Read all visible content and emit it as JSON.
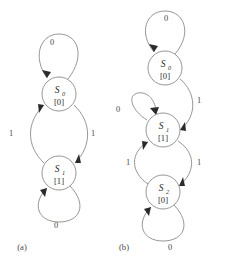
{
  "figure": {
    "background": "#ffffff",
    "stroke_color": "#8a8a8a",
    "text_color": "#2b2b2b",
    "panels": [
      {
        "id": "panel-a",
        "caption": "(a)",
        "caption_pos": {
          "x": 22,
          "y": 250
        },
        "states": [
          {
            "id": "s0",
            "name": "S",
            "subscript": "0",
            "output": "[0]",
            "cx": 59,
            "cy": 94,
            "r": 17
          },
          {
            "id": "s1",
            "name": "S",
            "subscript": "1",
            "output": "[1]",
            "cx": 59,
            "cy": 173,
            "r": 17
          }
        ],
        "transitions": [
          {
            "id": "a-s0-self",
            "from": "s0",
            "to": "s0",
            "label": "0",
            "label_pos": {
              "x": 52,
              "y": 45
            },
            "kind": "self-loop-top"
          },
          {
            "id": "a-s0-to-s1",
            "from": "s0",
            "to": "s1",
            "label": "1",
            "label_pos": {
              "x": 93,
              "y": 136
            },
            "kind": "arc-right-down"
          },
          {
            "id": "a-s1-to-s0",
            "from": "s1",
            "to": "s0",
            "label": "1",
            "label_pos": {
              "x": 11,
              "y": 136
            },
            "kind": "arc-left-up"
          },
          {
            "id": "a-s1-self",
            "from": "s1",
            "to": "s1",
            "label": "0",
            "label_pos": {
              "x": 56,
              "y": 228
            },
            "kind": "self-loop-bottom"
          }
        ]
      },
      {
        "id": "panel-b",
        "caption": "(b)",
        "caption_pos": {
          "x": 124,
          "y": 250
        },
        "states": [
          {
            "id": "s0",
            "name": "S",
            "subscript": "0",
            "output": "[0]",
            "cx": 165,
            "cy": 68,
            "r": 17
          },
          {
            "id": "s1",
            "name": "S",
            "subscript": "1",
            "output": "[1]",
            "cx": 163,
            "cy": 130,
            "r": 17
          },
          {
            "id": "s2",
            "name": "S",
            "subscript": "2",
            "output": "[0]",
            "cx": 163,
            "cy": 192,
            "r": 17
          }
        ],
        "transitions": [
          {
            "id": "b-s0-self",
            "from": "s0",
            "to": "s0",
            "label": "0",
            "label_pos": {
              "x": 166,
              "y": 21
            },
            "kind": "self-loop-top"
          },
          {
            "id": "b-s0-to-s1",
            "from": "s0",
            "to": "s1",
            "label": "1",
            "label_pos": {
              "x": 199,
              "y": 103
            },
            "kind": "arc-right-down"
          },
          {
            "id": "b-s1-self",
            "from": "s1",
            "to": "s1",
            "label": "0",
            "label_pos": {
              "x": 118,
              "y": 112
            },
            "kind": "self-loop-upper-left"
          },
          {
            "id": "b-s1-to-s2",
            "from": "s1",
            "to": "s2",
            "label": "1",
            "label_pos": {
              "x": 199,
              "y": 165
            },
            "kind": "arc-right-down"
          },
          {
            "id": "b-s2-to-s1",
            "from": "s2",
            "to": "s1",
            "label": "1",
            "label_pos": {
              "x": 128,
              "y": 165
            },
            "kind": "arc-left-up"
          },
          {
            "id": "b-s2-self",
            "from": "s2",
            "to": "s2",
            "label": "0",
            "label_pos": {
              "x": 170,
              "y": 250
            },
            "kind": "self-loop-bottom"
          }
        ]
      }
    ]
  }
}
